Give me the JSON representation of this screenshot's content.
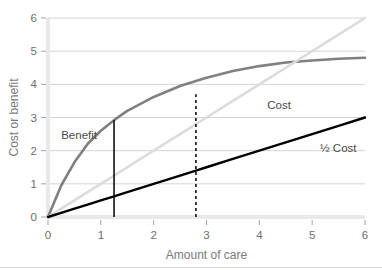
{
  "chart_data": {
    "type": "line",
    "title": "",
    "xlabel": "Amount of care",
    "ylabel": "Cost or benefit",
    "xlim": [
      0,
      6
    ],
    "ylim": [
      0,
      6
    ],
    "grid": true,
    "legend_position": "inline-annotations",
    "xticks": [
      "0",
      "1",
      "2",
      "3",
      "4",
      "5",
      "6"
    ],
    "yticks": [
      "0",
      "1",
      "2",
      "3",
      "4",
      "5",
      "6"
    ],
    "x": [
      0,
      0.25,
      0.5,
      0.75,
      1,
      1.25,
      1.5,
      2,
      2.5,
      2.8,
      3,
      3.5,
      4,
      4.5,
      5,
      5.5,
      6
    ],
    "series": [
      {
        "name": "Benefit",
        "label": "Benefit",
        "color": "#808080",
        "style": "solid",
        "width": 2.6,
        "values": [
          0,
          0.95,
          1.65,
          2.2,
          2.6,
          2.92,
          3.2,
          3.62,
          3.95,
          4.1,
          4.2,
          4.4,
          4.55,
          4.66,
          4.72,
          4.77,
          4.8
        ]
      },
      {
        "name": "Cost",
        "label": "Cost",
        "color": "#dcdcdc",
        "style": "solid",
        "width": 2.6,
        "values": [
          0,
          0.25,
          0.5,
          0.75,
          1,
          1.25,
          1.5,
          2,
          2.5,
          2.8,
          3,
          3.5,
          4,
          4.5,
          5,
          5.5,
          6
        ]
      },
      {
        "name": "HalfCost",
        "label": "½ Cost",
        "color": "#000000",
        "style": "solid",
        "width": 2.4,
        "values": [
          0,
          0.125,
          0.25,
          0.375,
          0.5,
          0.625,
          0.75,
          1,
          1.25,
          1.4,
          1.5,
          1.75,
          2,
          2.25,
          2.5,
          2.75,
          3
        ]
      }
    ],
    "annotations": [
      {
        "name": "solid-marker",
        "type": "vline",
        "x": 1.25,
        "y0": 0,
        "y1": 2.92,
        "style": "solid",
        "color": "#000000"
      },
      {
        "name": "dashed-marker",
        "type": "vline",
        "x": 2.8,
        "y0": 0,
        "y1": 3.7,
        "style": "dashed",
        "color": "#000000"
      }
    ],
    "labels": {
      "benefit": "Benefit",
      "cost": "Cost",
      "half_cost": "½ Cost"
    }
  }
}
